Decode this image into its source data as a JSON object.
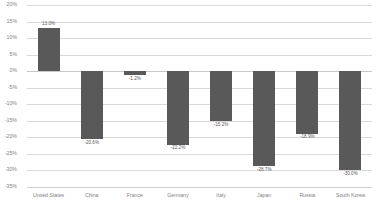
{
  "chart_data": {
    "type": "bar",
    "title": "",
    "subtitle": "",
    "xlabel": "",
    "ylabel": "",
    "categories": [
      "United States",
      "China",
      "France",
      "Germany",
      "Italy",
      "Japan",
      "Russia",
      "South Korea"
    ],
    "values": [
      13.0,
      -20.6,
      -1.2,
      -22.2,
      -15.2,
      -28.7,
      -18.9,
      -30.0
    ],
    "value_labels": [
      "13.0%",
      "-20.6%",
      "-1.2%",
      "-22.2%",
      "-15.2%",
      "-28.7%",
      "-18.9%",
      "-30.0%"
    ],
    "ylim": [
      -35,
      20
    ],
    "ytick_values": [
      20,
      15,
      10,
      5,
      0,
      -5,
      -10,
      -15,
      -20,
      -25,
      -30,
      -35
    ],
    "ytick_labels": [
      "20%",
      "15%",
      "10%",
      "5%",
      "0%",
      "-5%",
      "-10%",
      "-15%",
      "-20%",
      "-25%",
      "-30%",
      "-35%"
    ],
    "grid": true,
    "legend": "none",
    "bar_color": "#595959",
    "gridline_color": "#d9d9d9",
    "axis_text_color": "#7f7f7f",
    "background_color": "#ffffff"
  }
}
